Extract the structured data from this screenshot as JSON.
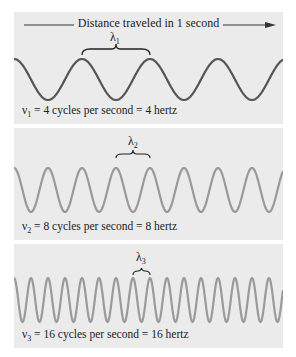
{
  "header": {
    "title": "Distance traveled in 1 second"
  },
  "panels": [
    {
      "wavelength_symbol": "λ",
      "wavelength_index": "1",
      "nu_symbol": "ν",
      "nu_index": "1",
      "equation": " = 4 cycles per second = 4 hertz",
      "cycles": 4,
      "wave_color": "#555555"
    },
    {
      "wavelength_symbol": "λ",
      "wavelength_index": "2",
      "nu_symbol": "ν",
      "nu_index": "2",
      "equation": " = 8 cycles per second = 8 hertz",
      "cycles": 8,
      "wave_color": "#9a9a9a"
    },
    {
      "wavelength_symbol": "λ",
      "wavelength_index": "3",
      "nu_symbol": "ν",
      "nu_index": "3",
      "equation": " = 16 cycles per second = 16 hertz",
      "cycles": 16,
      "wave_color": "#9a9a9a"
    }
  ],
  "colors": {
    "panel_bg": "#ebebeb",
    "text": "#222222",
    "arrow": "#333333"
  }
}
